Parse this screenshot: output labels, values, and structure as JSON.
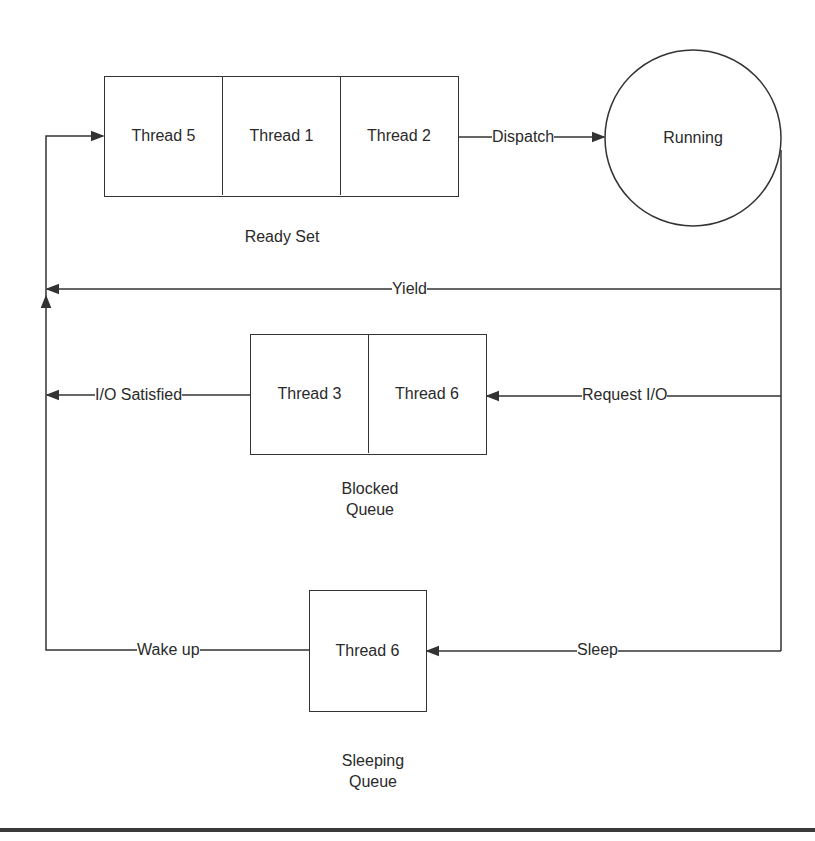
{
  "diagram": {
    "colors": {
      "line": "#333333",
      "text": "#2a2a2a",
      "background": "#ffffff",
      "rule": "#3a3a3a"
    },
    "ready_set": {
      "caption": "Ready Set",
      "threads": [
        "Thread 5",
        "Thread 1",
        "Thread 2"
      ]
    },
    "running": {
      "label": "Running"
    },
    "blocked_queue": {
      "caption_line1": "Blocked",
      "caption_line2": "Queue",
      "threads": [
        "Thread 3",
        "Thread 6"
      ]
    },
    "sleeping_queue": {
      "caption_line1": "Sleeping",
      "caption_line2": "Queue",
      "threads": [
        "Thread 6"
      ]
    },
    "transitions": {
      "dispatch": "Dispatch",
      "yield": "Yield",
      "io_satisfied": "I/O Satisfied",
      "request_io": "Request I/O",
      "wake_up": "Wake up",
      "sleep": "Sleep"
    }
  }
}
